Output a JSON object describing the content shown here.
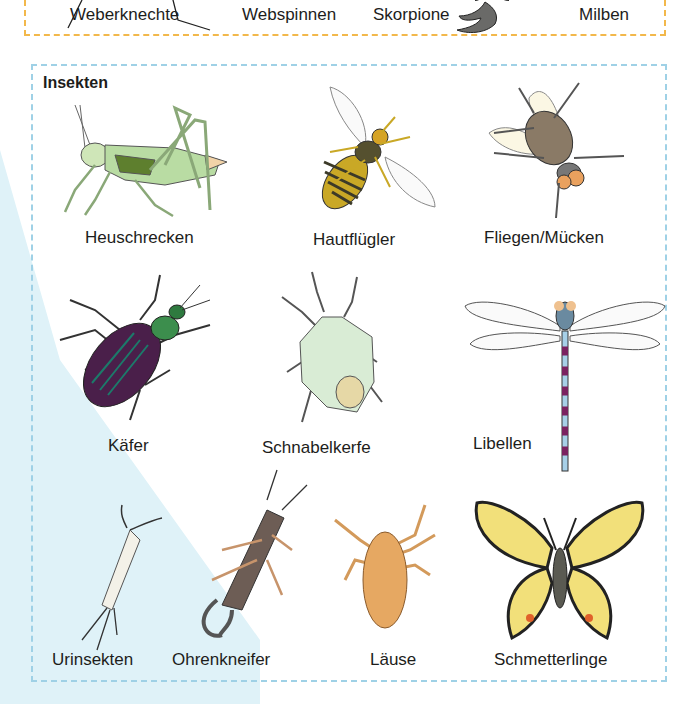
{
  "arachnids": {
    "border_color": "#f2b84b",
    "items": [
      {
        "label": "Weberknechte",
        "icon": "harvestman-icon"
      },
      {
        "label": "Webspinnen",
        "icon": "spider-icon"
      },
      {
        "label": "Skorpione",
        "icon": "scorpion-icon"
      },
      {
        "label": "Milben",
        "icon": "mite-icon"
      }
    ]
  },
  "insects": {
    "title": "Insekten",
    "border_color": "#9fd1e6",
    "background_tint": "#dff2f8",
    "items": [
      {
        "label": "Heuschrecken",
        "icon": "grasshopper-icon"
      },
      {
        "label": "Hautflügler",
        "icon": "wasp-icon"
      },
      {
        "label": "Fliegen/Mücken",
        "icon": "fly-icon"
      },
      {
        "label": "Käfer",
        "icon": "beetle-icon"
      },
      {
        "label": "Schnabelkerfe",
        "icon": "shield-bug-icon"
      },
      {
        "label": "Libellen",
        "icon": "dragonfly-icon"
      },
      {
        "label": "Urinsekten",
        "icon": "silverfish-icon"
      },
      {
        "label": "Ohrenkneifer",
        "icon": "earwig-icon"
      },
      {
        "label": "Läuse",
        "icon": "louse-icon"
      },
      {
        "label": "Schmetterlinge",
        "icon": "butterfly-icon"
      }
    ]
  }
}
